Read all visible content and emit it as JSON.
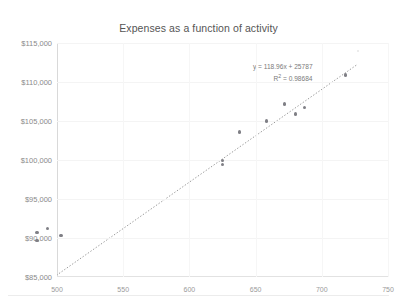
{
  "top_cut_text": "",
  "chart_data": {
    "type": "scatter",
    "title": "Expenses as a function of activity",
    "xlabel": "",
    "ylabel": "",
    "xlim": [
      500,
      750
    ],
    "ylim": [
      85000,
      115000
    ],
    "grid": true,
    "legend": "none",
    "x_ticks": [
      500,
      550,
      600,
      650,
      700,
      750
    ],
    "x_tick_labels": [
      "500",
      "550",
      "600",
      "650",
      "700",
      "750"
    ],
    "y_ticks": [
      85000,
      90000,
      95000,
      100000,
      105000,
      110000,
      115000
    ],
    "y_tick_labels": [
      "$85,000",
      "$90,000",
      "$95,000",
      "$100,000",
      "$105,000",
      "$110,000",
      "$115,000"
    ],
    "series": [
      {
        "name": "Expenses",
        "marker": "circle",
        "color": "#7f7f85",
        "points": [
          {
            "x": 485,
            "y": 90700
          },
          {
            "x": 485,
            "y": 89700
          },
          {
            "x": 493,
            "y": 91200
          },
          {
            "x": 503,
            "y": 90300
          },
          {
            "x": 625,
            "y": 99900
          },
          {
            "x": 625,
            "y": 99400
          },
          {
            "x": 638,
            "y": 103600
          },
          {
            "x": 658,
            "y": 105000
          },
          {
            "x": 672,
            "y": 107200
          },
          {
            "x": 680,
            "y": 105900
          },
          {
            "x": 687,
            "y": 106700
          },
          {
            "x": 718,
            "y": 110900
          }
        ]
      }
    ],
    "trendline": {
      "type": "linear",
      "style": "dotted",
      "color": "#9a9a9a",
      "slope": 118.96,
      "intercept": 25787,
      "r_squared": 0.98684,
      "equation_label": "y = 118.96x + 25787",
      "r2_label_prefix": "R",
      "r2_label_exponent": "2",
      "r2_label_value": " = 0.98684",
      "x_start": 478,
      "x_end": 726
    }
  }
}
